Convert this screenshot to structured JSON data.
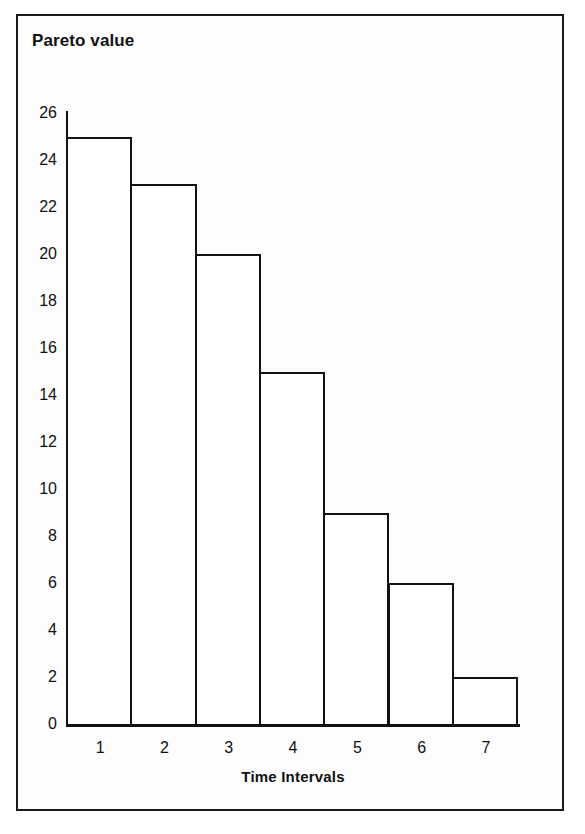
{
  "figure": {
    "background_color": "#fdfdfd",
    "frame_color": "#1a1a1a",
    "line_color": "#111111"
  },
  "chart_data": {
    "type": "bar",
    "title": "Pareto value",
    "xlabel": "Time Intervals",
    "ylabel": "",
    "categories": [
      "1",
      "2",
      "3",
      "4",
      "5",
      "6",
      "7"
    ],
    "values": [
      25,
      23,
      20,
      15,
      9,
      6,
      2
    ],
    "ytick_labels": [
      "0",
      "2",
      "4",
      "6",
      "8",
      "10",
      "12",
      "14",
      "16",
      "18",
      "20",
      "22",
      "24",
      "26"
    ],
    "ytick_values": [
      0,
      2,
      4,
      6,
      8,
      10,
      12,
      14,
      16,
      18,
      20,
      22,
      24,
      26
    ],
    "ylim": [
      0,
      26
    ],
    "xlim": [
      0.5,
      7.5
    ],
    "grid": false,
    "legend": false,
    "bar_fill": "#ffffff",
    "bar_edge": "#111111",
    "bars_adjacent": true
  }
}
